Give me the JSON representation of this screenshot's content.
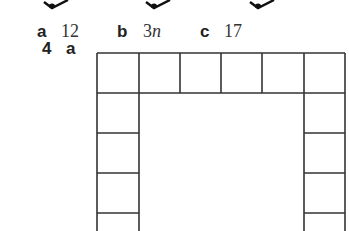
{
  "answers_row": {
    "items": [
      {
        "label": "a",
        "value": "12"
      },
      {
        "label": "b",
        "value": "3",
        "value_italic": "n"
      },
      {
        "label": "c",
        "value": "17"
      }
    ]
  },
  "question": {
    "number": "4",
    "part": "a"
  },
  "diagram": {
    "top_row_squares": 6,
    "side_columns_visible_squares": 4,
    "line_color": "#333333"
  },
  "top_fragments": {
    "count": 3,
    "description": "Bottom tips of diagrams cut off at the top of the page"
  }
}
